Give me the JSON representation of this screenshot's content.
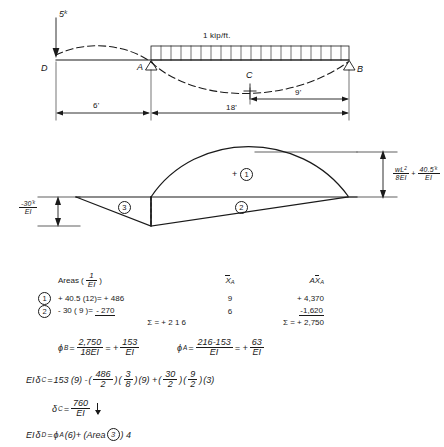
{
  "figure": {
    "beam_diagram": {
      "point_load_label": "5",
      "point_load_unit_sup": "k",
      "distributed_load_label": "1 kip/ft.",
      "node_d": "D",
      "node_a": "A",
      "node_b": "B",
      "node_c": "C",
      "dim_overhang": "6'",
      "dim_span": "18'",
      "dim_half_span": "9'"
    },
    "moment_diagram": {
      "region1_sign": "+",
      "region1_tag": "1",
      "region2_tag": "2",
      "region3_tag": "3",
      "right_label": {
        "frac_num": "wL",
        "frac_num_sup": "2",
        "frac_den": "8EI",
        "plus": "+",
        "frac2_num": "40.5",
        "frac2_num_sup": "'k",
        "frac2_den": "EI"
      },
      "left_label": {
        "num": "-30",
        "num_sup": "'k",
        "den": "EI"
      }
    }
  },
  "table": {
    "headers": {
      "tag": "",
      "areas": "Areas (",
      "areas_frac_num": "1",
      "areas_frac_den": "EI",
      "areas_close": ")",
      "xa": "X",
      "xa_sub": "A",
      "axa_a": "A",
      "axa_x": "X",
      "axa_sub": "A"
    },
    "rows": [
      {
        "tag": "1",
        "coef": "+ 40.5",
        "mult": "(12)",
        "equals": "=",
        "area": "+ 486",
        "xa": "9",
        "axa": "+ 4,370"
      },
      {
        "tag": "2",
        "coef": "- 30",
        "mult": "( 9 )",
        "equals": "=",
        "area": "- 270",
        "xa": "6",
        "axa": "-1,620"
      }
    ],
    "sums": {
      "sigma": "Σ =",
      "area_total": "+ 2 1 6",
      "axa_total": "+ 2,750"
    }
  },
  "equations": {
    "phi_b": {
      "symbol": "ϕ",
      "sub": "B",
      "eq1": "=",
      "num": "2,750",
      "den": "18EI",
      "eq2": "= +",
      "num2": "153",
      "den2": "EI"
    },
    "phi_a": {
      "symbol": "ϕ",
      "sub": "A",
      "eq1": "=",
      "num": "216-153",
      "den": "EI",
      "eq2": "= +",
      "num2": "63",
      "den2": "EI"
    },
    "delta_c_work": {
      "lead": "EI",
      "delta": "δ",
      "sub": "C",
      "eq": "=",
      "t1": "153 (9) -",
      "f1_num": "486",
      "f1_den": "2",
      "t2": "",
      "f2_num": "3",
      "f2_den": "8",
      "t3": "(9) +",
      "f3_num": "30",
      "f3_den": "2",
      "f4_num": "9",
      "f4_den": "2",
      "t4": "(3)"
    },
    "delta_c_result": {
      "delta": "δ",
      "sub": "C",
      "eq": "=",
      "num": "760",
      "den": "EI"
    },
    "delta_d": {
      "lead": "EI",
      "delta": "δ",
      "sub": "D",
      "eq": "=",
      "phi": "ϕ",
      "phi_sub": "A",
      "t1": "(6)+ (Area",
      "tag": "3",
      "t2": ") 4"
    }
  },
  "colors": {
    "ink": "#1a1a1a",
    "paper": "#ffffff"
  }
}
